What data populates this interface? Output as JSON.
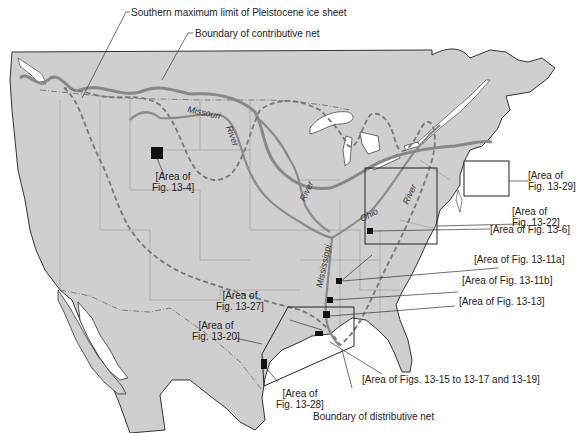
{
  "figure": {
    "type": "map",
    "region": "North America (United States, southern Canada, northern Mexico)",
    "colors": {
      "land": "#cfcfcf",
      "water": "#ffffff",
      "coastline": "#333333",
      "river": "#8a8a8a",
      "ice_limit": "#777777",
      "boundaries": "#666666",
      "area_box": "#222222"
    }
  },
  "callouts": {
    "ice_limit": "Southern maximum limit of Pleistocene ice sheet",
    "contributive_net": "Boundary of contributive net",
    "distributive_net": "Boundary of distributive net"
  },
  "rivers": {
    "missouri_1": "Missouri",
    "missouri_2": "River",
    "mid_river": "River",
    "ohio_1": "Ohio",
    "ohio_2": "River",
    "mississippi": "Mississippi"
  },
  "areas": {
    "fig_13_4": {
      "line1": "[Area of",
      "line2": "Fig. 13-4]"
    },
    "fig_13_29": {
      "line1": "[Area of",
      "line2": "Fig. 13-29]"
    },
    "fig_13_22": {
      "line1": "[Area of",
      "line2": "Fig. 13-22]"
    },
    "fig_13_6": {
      "line1": "[Area of Fig. 13-6]"
    },
    "fig_13_11a": {
      "line1": "[Area of Fig. 13-11a]"
    },
    "fig_13_11b": {
      "line1": "[Area of Fig. 13-11b]"
    },
    "fig_13_13": {
      "line1": "[Area of Fig. 13-13]"
    },
    "fig_13_27": {
      "line1": "[Area of",
      "line2": "Fig. 13-27]"
    },
    "fig_13_20": {
      "line1": "[Area of",
      "line2": "Fig. 13-20]"
    },
    "fig_13_28": {
      "line1": "[Area of",
      "line2": "Fig. 13-28]"
    },
    "figs_13_15_19": {
      "line1": "[Area of Figs. 13-15 to 13-17 and 13-19]"
    }
  }
}
